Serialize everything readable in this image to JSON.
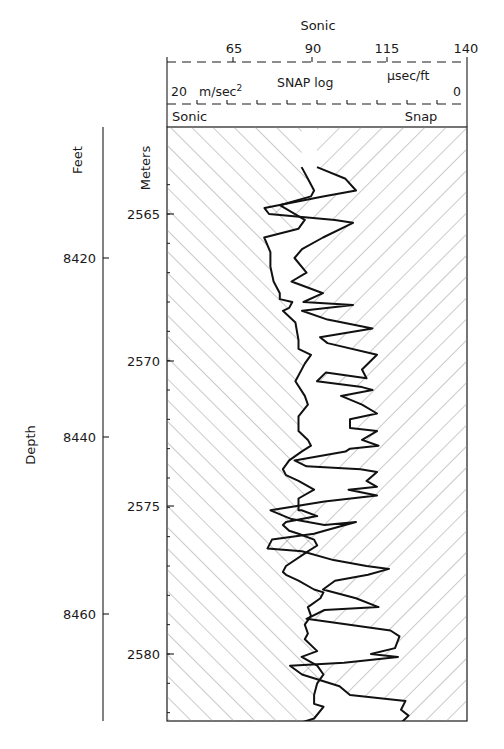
{
  "chart_data": {
    "type": "line",
    "title": "",
    "header": {
      "top_axis_title": "Sonic",
      "top_axis_ticks": [
        "65",
        "90",
        "115",
        "140"
      ],
      "top_axis_units": "µsec/ft",
      "second_axis_title": "SNAP log",
      "second_axis_left": "20",
      "second_axis_units": "m/sec²",
      "second_axis_right": "0",
      "track_left_label": "Sonic",
      "track_right_label": "Snap"
    },
    "ylabel": "Depth",
    "y_axes": {
      "feet": {
        "label": "Feet",
        "ticks": [
          "8420",
          "8440",
          "8460"
        ]
      },
      "meters": {
        "label": "Meters",
        "ticks": [
          "2565",
          "2570",
          "2575",
          "2580"
        ]
      }
    },
    "series": [
      {
        "name": "Sonic",
        "units": "µsec/ft",
        "depth_m": [
          2563.4,
          2563.8,
          2564.2,
          2564.4,
          2564.7,
          2565.2,
          2565.5,
          2565.8,
          2566.3,
          2566.8,
          2567.3,
          2567.7,
          2567.9,
          2568.0,
          2568.2,
          2568.3,
          2568.7,
          2569.3,
          2569.6,
          2569.8,
          2570.1,
          2570.7,
          2571.2,
          2571.5,
          2571.9,
          2572.4,
          2572.7,
          2572.9,
          2573.1,
          2573.4,
          2573.7,
          2573.9,
          2574.1,
          2574.4,
          2574.7,
          2574.9,
          2575.1,
          2575.1,
          2575.3,
          2575.5,
          2575.6,
          2575.8,
          2575.9,
          2576.1,
          2576.3,
          2576.5,
          2577.0,
          2577.2,
          2577.3,
          2577.5,
          2577.8,
          2577.9,
          2578.1,
          2578.4,
          2578.7,
          2579.0,
          2579.3,
          2579.5,
          2579.9,
          2580.1,
          2580.4,
          2580.7,
          2581.0,
          2581.4,
          2581.7,
          2581.8,
          2582.2,
          2582.4,
          2582.6,
          2582.8
        ],
        "values": [
          87,
          89,
          91,
          90,
          80,
          88,
          86,
          75,
          77,
          77,
          78,
          80,
          80,
          84,
          83,
          81,
          85,
          86,
          86,
          90,
          88,
          85,
          88,
          89,
          86,
          86,
          89,
          90,
          87,
          83,
          81,
          82,
          86,
          91,
          86,
          86,
          86,
          87,
          92,
          82,
          81,
          83,
          86,
          91,
          92,
          89,
          82,
          81,
          82,
          86,
          91,
          94,
          93,
          89,
          90,
          88,
          89,
          88,
          92,
          87,
          92,
          94,
          92,
          91,
          91,
          94,
          91,
          85,
          80,
          86
        ]
      },
      {
        "name": "Snap",
        "units": "m/sec²",
        "depth_m": [
          2563.4,
          2563.8,
          2564.2,
          2564.4,
          2564.8,
          2565.0,
          2565.2,
          2565.3,
          2565.8,
          2566.2,
          2566.5,
          2567.0,
          2567.3,
          2567.7,
          2568.0,
          2568.1,
          2568.3,
          2568.6,
          2568.9,
          2569.2,
          2569.4,
          2569.8,
          2570.3,
          2570.6,
          2570.4,
          2570.7,
          2570.9,
          2571.0,
          2571.2,
          2571.5,
          2571.8,
          2572.0,
          2572.3,
          2572.4,
          2572.7,
          2572.9,
          2573.0,
          2573.1,
          2573.4,
          2573.6,
          2573.7,
          2573.8,
          2574.1,
          2574.3,
          2574.4,
          2574.6,
          2574.8,
          2575.1,
          2575.4,
          2575.6,
          2575.5,
          2575.8,
          2575.9,
          2576.1,
          2576.4,
          2576.5,
          2576.8,
          2577.0,
          2577.1,
          2577.3,
          2577.5,
          2577.8,
          2578.1,
          2578.4,
          2578.5,
          2578.8,
          2579.2,
          2579.4,
          2579.8,
          2580.0,
          2580.1,
          2580.3,
          2580.4,
          2580.7,
          2581.1,
          2581.4,
          2581.6,
          2581.9,
          2582.1,
          2582.4,
          2582.6,
          2582.8
        ],
        "values": [
          10.0,
          8.1,
          7.4,
          9.6,
          13.5,
          13.2,
          8.8,
          7.6,
          9.6,
          11.0,
          11.5,
          10.7,
          11.7,
          9.6,
          10.9,
          7.6,
          11.0,
          9.3,
          6.3,
          9.8,
          9.3,
          6.0,
          7.0,
          6.7,
          9.4,
          10.0,
          7.0,
          6.3,
          8.4,
          7.0,
          6.0,
          7.8,
          7.8,
          6.0,
          7.0,
          5.9,
          7.8,
          8.1,
          11.5,
          10.7,
          7.1,
          6.0,
          6.7,
          6.0,
          7.9,
          6.0,
          9.5,
          13.1,
          11.7,
          9.5,
          7.4,
          9.5,
          10.2,
          13.0,
          13.3,
          11.0,
          8.9,
          6.7,
          5.2,
          6.6,
          8.8,
          9.6,
          7.4,
          5.9,
          9.5,
          10.7,
          5.1,
          4.5,
          4.8,
          6.4,
          4.6,
          8.2,
          11.8,
          11.0,
          8.5,
          7.8,
          4.1,
          4.4,
          3.9,
          4.5,
          7.6,
          13.6
        ]
      }
    ],
    "xlim_sonic": [
      40,
      140
    ],
    "xlim_snap": [
      20,
      0
    ],
    "ylim_m": [
      2563.4,
      2582.8
    ],
    "fill": {
      "sonic": "hatched left of curve (/)",
      "snap": "hatched right of curve (\\)"
    },
    "grid": false,
    "legend": "track header labels"
  },
  "colors": {
    "ink": "#1a1a1a",
    "hatch": "#8a8a8a",
    "background": "#ffffff"
  }
}
